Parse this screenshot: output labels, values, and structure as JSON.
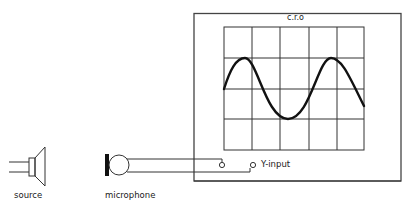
{
  "diagram": {
    "title": "c.r.o",
    "labels": {
      "source": "source",
      "microphone": "microphone",
      "y_input": "Y-input"
    },
    "screen": {
      "columns": 5,
      "rows": 4,
      "trace": "sine wave"
    },
    "colors": {
      "line": "#222222",
      "grid": "#333333",
      "background": "#ffffff"
    }
  }
}
